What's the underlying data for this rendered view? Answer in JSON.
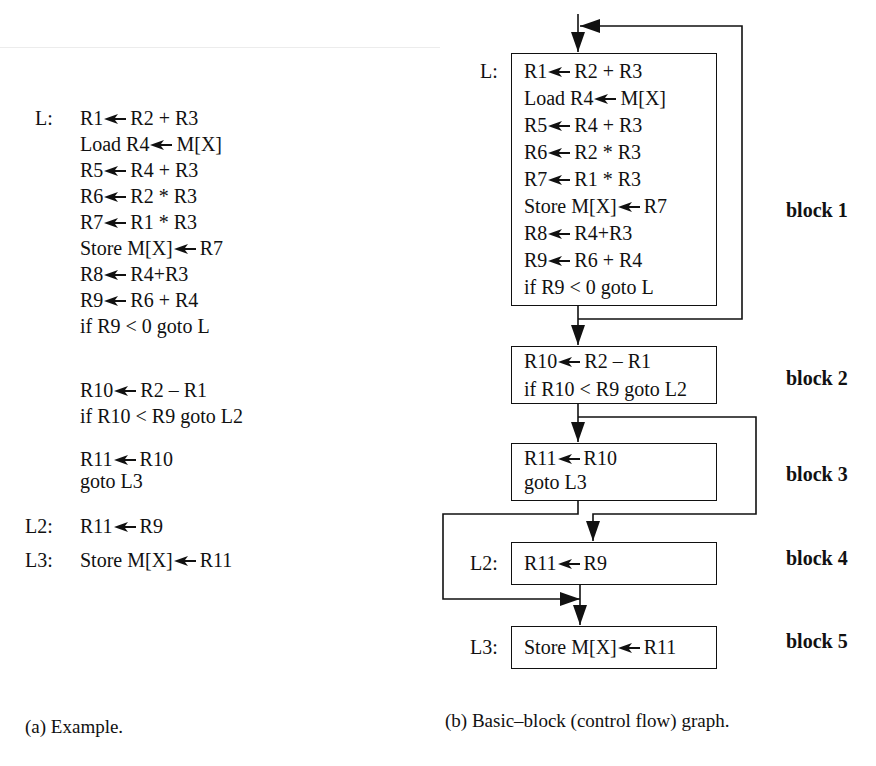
{
  "panel_a": {
    "caption": "(a) Example.",
    "lines": [
      {
        "label": "L:",
        "lhs": "R1",
        "rhs": "R2 + R3"
      },
      {
        "label": "",
        "lhs": "Load R4",
        "rhs": "M[X]"
      },
      {
        "label": "",
        "lhs": "R5",
        "rhs": "R4 + R3"
      },
      {
        "label": "",
        "lhs": "R6",
        "rhs": "R2 * R3"
      },
      {
        "label": "",
        "lhs": "R7",
        "rhs": "R1 * R3"
      },
      {
        "label": "",
        "lhs": "Store M[X]",
        "rhs": "R7"
      },
      {
        "label": "",
        "lhs": "R8",
        "rhs": "R4+R3"
      },
      {
        "label": "",
        "lhs": "R9",
        "rhs": "R6 + R4"
      },
      {
        "label": "",
        "text": "if R9 < 0 goto L"
      },
      {
        "label": "",
        "lhs": "R10",
        "rhs": "R2 – R1"
      },
      {
        "label": "",
        "text": "if R10 < R9 goto L2"
      },
      {
        "label": "",
        "lhs": "R11",
        "rhs": "R10"
      },
      {
        "label": "",
        "text": "goto L3"
      },
      {
        "label": "L2:",
        "lhs": "R11",
        "rhs": "R9"
      },
      {
        "label": "L3:",
        "lhs": "Store M[X]",
        "rhs": "R11"
      }
    ]
  },
  "panel_b": {
    "caption": "(b) Basic–block (control flow) graph.",
    "blocks": [
      {
        "name": "block 1",
        "label": "L:",
        "lines": [
          {
            "lhs": "R1",
            "rhs": "R2 + R3"
          },
          {
            "lhs": "Load R4",
            "rhs": "M[X]"
          },
          {
            "lhs": "R5",
            "rhs": "R4 + R3"
          },
          {
            "lhs": "R6",
            "rhs": "R2 * R3"
          },
          {
            "lhs": "R7",
            "rhs": "R1 * R3"
          },
          {
            "lhs": "Store M[X]",
            "rhs": "R7"
          },
          {
            "lhs": "R8",
            "rhs": "R4+R3"
          },
          {
            "lhs": "R9",
            "rhs": "R6 + R4"
          },
          {
            "text": "if R9 < 0 goto L"
          }
        ]
      },
      {
        "name": "block 2",
        "label": "",
        "lines": [
          {
            "lhs": "R10",
            "rhs": "R2 – R1"
          },
          {
            "text": "if R10 < R9 goto L2"
          }
        ]
      },
      {
        "name": "block 3",
        "label": "",
        "lines": [
          {
            "lhs": "R11",
            "rhs": "R10"
          },
          {
            "text": "goto L3"
          }
        ]
      },
      {
        "name": "block 4",
        "label": "L2:",
        "lines": [
          {
            "lhs": "R11",
            "rhs": "R9"
          }
        ]
      },
      {
        "name": "block 5",
        "label": "L3:",
        "lines": [
          {
            "lhs": "Store M[X]",
            "rhs": "R11"
          }
        ]
      }
    ]
  }
}
